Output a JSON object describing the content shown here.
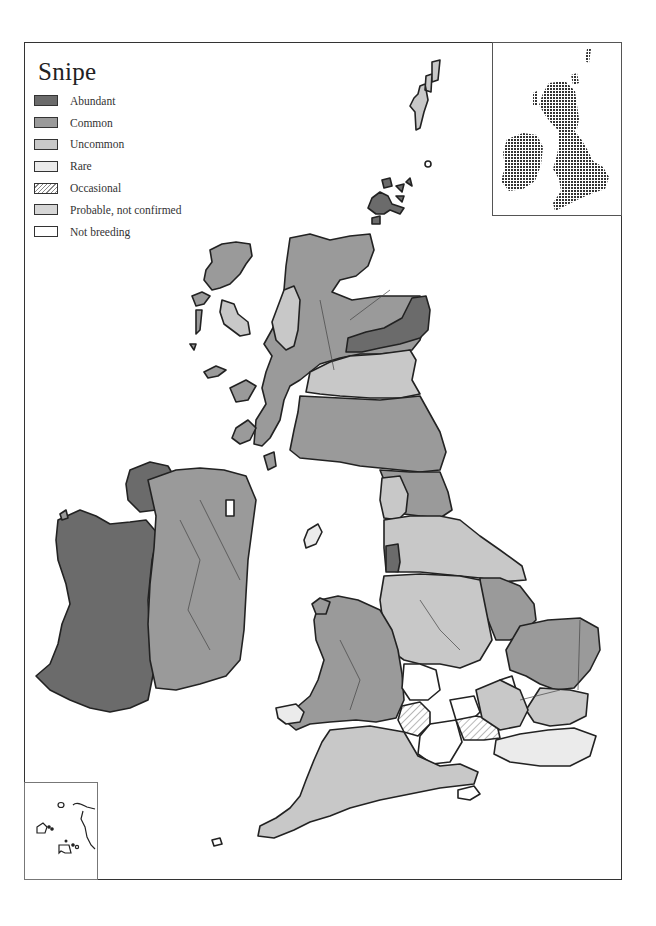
{
  "map": {
    "title": "Snipe",
    "legend": [
      {
        "label": "Abundant",
        "color": "#6b6b6b",
        "pattern": "solid"
      },
      {
        "label": "Common",
        "color": "#9a9a9a",
        "pattern": "solid"
      },
      {
        "label": "Uncommon",
        "color": "#c8c8c8",
        "pattern": "solid"
      },
      {
        "label": "Rare",
        "color": "#ebebeb",
        "pattern": "solid"
      },
      {
        "label": "Occasional",
        "color": "#ffffff",
        "pattern": "hatched"
      },
      {
        "label": "Probable, not confirmed",
        "color": "#d6d6d6",
        "pattern": "solid"
      },
      {
        "label": "Not breeding",
        "color": "#ffffff",
        "pattern": "solid"
      }
    ],
    "regions": {
      "ireland_west": "Abundant",
      "ireland_east": "Common",
      "scotland_northeast_band": "Abundant",
      "scotland_highlands": "Common",
      "scotland_northwest_coast": "Uncommon",
      "scotland_east_central": "Uncommon",
      "orkney": "Abundant",
      "shetland": "Uncommon",
      "outer_hebrides": "Common",
      "northern_england_north": "Common",
      "lancashire_coast": "Abundant",
      "wales": "Common",
      "east_anglia": "Common",
      "midlands": "Uncommon",
      "southern_england_central": "Not breeding",
      "occasional_area": "Occasional",
      "southeast_england": "Rare",
      "southwest_england": "Uncommon"
    },
    "insets": {
      "overview": "Dot-distribution inset map of Britain and Ireland",
      "channel_isles": "Channel Islands inset"
    }
  }
}
